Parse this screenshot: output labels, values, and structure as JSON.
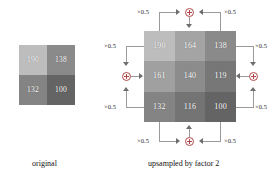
{
  "figure": {
    "panels": [
      {
        "id": "original",
        "caption": "original",
        "grid": {
          "rows": 2,
          "cols": 2,
          "cells": [
            {
              "value": "190",
              "gray": "#bdbdbd"
            },
            {
              "value": "138",
              "gray": "#8a8a8a"
            },
            {
              "value": "132",
              "gray": "#848484"
            },
            {
              "value": "100",
              "gray": "#646464"
            }
          ]
        }
      },
      {
        "id": "upsampled",
        "caption": "upsampled by factor 2",
        "grid": {
          "rows": 3,
          "cols": 3,
          "cells": [
            {
              "value": "190",
              "gray": "#bdbdbd"
            },
            {
              "value": "164",
              "gray": "#a4a4a4"
            },
            {
              "value": "138",
              "gray": "#8a8a8a"
            },
            {
              "value": "161",
              "gray": "#a0a0a0"
            },
            {
              "value": "140",
              "gray": "#8c8c8c"
            },
            {
              "value": "119",
              "gray": "#777777"
            },
            {
              "value": "132",
              "gray": "#848484"
            },
            {
              "value": "116",
              "gray": "#747474"
            },
            {
              "value": "100",
              "gray": "#646464"
            }
          ]
        }
      }
    ],
    "annotations": {
      "weight_label": "×0.5",
      "operator_symbol": "⊕",
      "groups": [
        {
          "side": "top",
          "left_label": "×0.5",
          "right_label": "×0.5"
        },
        {
          "side": "left",
          "left_label": "×0.5",
          "right_label": "×0.5"
        },
        {
          "side": "right",
          "left_label": "×0.5",
          "right_label": "×0.5"
        },
        {
          "side": "bottom",
          "left_label": "×0.5",
          "right_label": "×0.5"
        }
      ]
    }
  }
}
